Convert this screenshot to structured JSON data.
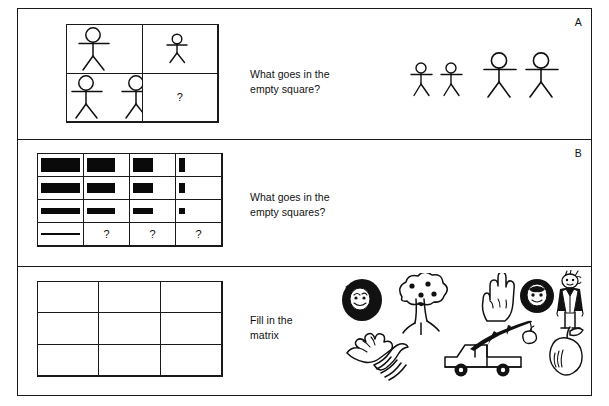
{
  "figure": {
    "panels": [
      {
        "letter": "A",
        "prompt": "What goes in the\nempty square?",
        "grid": {
          "rows": 2,
          "cols": 2,
          "cells": [
            {
              "content": "one-large-stick-figure",
              "count": 1,
              "size": "large"
            },
            {
              "content": "one-small-stick-figure",
              "count": 1,
              "size": "small"
            },
            {
              "content": "two-large-stick-figures",
              "count": 2,
              "size": "large"
            },
            {
              "content": "question-mark",
              "label": "?"
            }
          ]
        },
        "answer_options": [
          {
            "name": "option-two-small-figures",
            "count": 2,
            "size": "small"
          },
          {
            "name": "option-two-large-figures",
            "count": 2,
            "size": "large"
          }
        ]
      },
      {
        "letter": "B",
        "prompt": "What goes in the\nempty squares?",
        "grid": {
          "rows": 4,
          "cols": 4,
          "cells": [
            {
              "content": "black-bar",
              "width_pct": 92,
              "height_pct": 62
            },
            {
              "content": "black-bar",
              "width_pct": 66,
              "height_pct": 62
            },
            {
              "content": "black-bar",
              "width_pct": 48,
              "height_pct": 62
            },
            {
              "content": "black-bar",
              "width_pct": 14,
              "height_pct": 62
            },
            {
              "content": "black-bar",
              "width_pct": 92,
              "height_pct": 45
            },
            {
              "content": "black-bar",
              "width_pct": 66,
              "height_pct": 45
            },
            {
              "content": "black-bar",
              "width_pct": 48,
              "height_pct": 45
            },
            {
              "content": "black-bar",
              "width_pct": 14,
              "height_pct": 45
            },
            {
              "content": "black-bar",
              "width_pct": 92,
              "height_pct": 28
            },
            {
              "content": "black-bar",
              "width_pct": 66,
              "height_pct": 28
            },
            {
              "content": "black-bar",
              "width_pct": 48,
              "height_pct": 28
            },
            {
              "content": "black-bar",
              "width_pct": 14,
              "height_pct": 28
            },
            {
              "content": "black-bar",
              "width_pct": 92,
              "height_pct": 11
            },
            {
              "content": "question-mark",
              "label": "?"
            },
            {
              "content": "question-mark",
              "label": "?"
            },
            {
              "content": "question-mark",
              "label": "?"
            }
          ]
        }
      },
      {
        "letter": "C",
        "prompt": "Fill in the\nmatrix",
        "grid": {
          "rows": 3,
          "cols": 3,
          "cells": []
        },
        "illustrations": [
          {
            "name": "record-disc-with-face",
            "row": "top"
          },
          {
            "name": "apple-tree",
            "row": "top"
          },
          {
            "name": "open-hand",
            "row": "top"
          },
          {
            "name": "dark-disc-with-face",
            "row": "top"
          },
          {
            "name": "man-in-suit",
            "row": "top"
          },
          {
            "name": "branch-with-apple",
            "row": "middle"
          },
          {
            "name": "hand-with-striped-sleeve",
            "row": "bottom"
          },
          {
            "name": "pickup-truck",
            "row": "bottom"
          },
          {
            "name": "apple",
            "row": "bottom"
          }
        ]
      }
    ]
  },
  "colors": {
    "ink": "#111111",
    "paper": "#ffffff",
    "bar_fill": "#0a0a0a"
  }
}
